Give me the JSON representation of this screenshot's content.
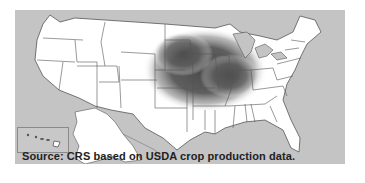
{
  "map": {
    "subject": "United States corn production concentration",
    "region_highlighted": "Corn Belt (Midwest)",
    "colors": {
      "background": "#c4c4c4",
      "states": "#ffffff",
      "borders": "#555555",
      "high_density": "#4a4a4a"
    },
    "insets": [
      "Alaska",
      "Hawaii"
    ]
  },
  "caption": {
    "source": "Source: CRS based on USDA crop production data."
  }
}
